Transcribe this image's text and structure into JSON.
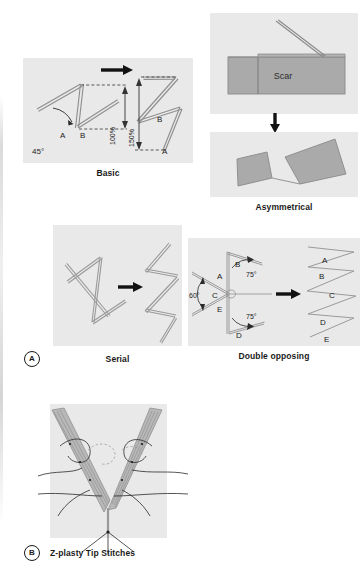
{
  "figure": {
    "background_color": "#ffffff",
    "panel_background_color": "#e9e9e9",
    "flap_fill_color": "#aaaaaa",
    "line_color": "#8a8a8a",
    "text_color": "#1a1a1a"
  },
  "panels": {
    "basic": {
      "caption": "Basic",
      "labels": {
        "angle_45": "45°",
        "left_a": "A",
        "left_b": "B",
        "right_a": "A",
        "right_b": "B",
        "gain_before": "100%",
        "gain_after": "150%"
      }
    },
    "asymmetrical": {
      "caption": "Asymmetrical",
      "labels": {
        "scar": "Scar"
      }
    },
    "serial": {
      "caption": "Serial",
      "panel_letter": "A"
    },
    "double_opposing": {
      "caption": "Double opposing",
      "labels": {
        "flap_a": "A",
        "flap_b": "B",
        "flap_c": "C",
        "flap_d": "D",
        "flap_e": "E",
        "angle_60": "60°",
        "angle_75_upper": "75°",
        "angle_75_lower": "75°",
        "result_a": "A",
        "result_b": "B",
        "result_c": "C",
        "result_d": "D",
        "result_e": "E"
      }
    },
    "tip_stitches": {
      "caption": "Z-plasty Tip Stitches",
      "panel_letter": "B"
    }
  }
}
